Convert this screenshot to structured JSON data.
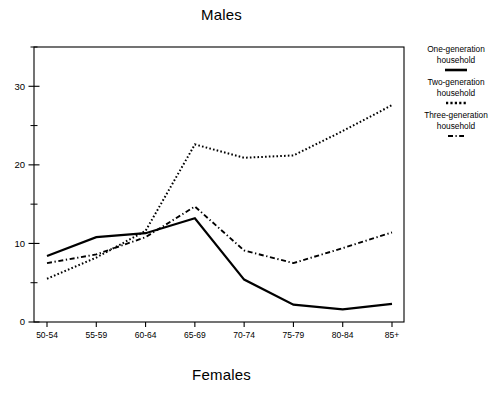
{
  "titles": {
    "top": "Males",
    "bottom": "Females"
  },
  "legend": {
    "entries": [
      {
        "label": "One-generation household",
        "style": "solid"
      },
      {
        "label": "Two-generation household",
        "style": "dotted"
      },
      {
        "label": "Three-generation household",
        "style": "dash-dot"
      }
    ]
  },
  "chart_data": {
    "type": "line",
    "title": "Males",
    "xlabel": "Females",
    "ylabel": "",
    "categories": [
      "50-54",
      "55-59",
      "60-64",
      "65-69",
      "70-74",
      "75-79",
      "80-84",
      "85+"
    ],
    "ylim": [
      0,
      35
    ],
    "yticks": [
      0,
      10,
      20,
      30
    ],
    "yticks_minor": [
      5,
      15,
      25,
      35
    ],
    "grid": false,
    "legend_position": "right",
    "series": [
      {
        "name": "One-generation household",
        "style": "solid",
        "values": [
          8.4,
          10.8,
          11.3,
          13.2,
          5.4,
          2.2,
          1.6,
          2.3
        ]
      },
      {
        "name": "Two-generation household",
        "style": "dotted",
        "values": [
          5.5,
          8.2,
          11.6,
          22.6,
          20.9,
          21.2,
          24.3,
          27.6
        ]
      },
      {
        "name": "Three-generation household",
        "style": "dash-dot",
        "values": [
          7.5,
          8.6,
          10.8,
          14.7,
          9.1,
          7.5,
          9.4,
          11.4
        ]
      }
    ]
  }
}
